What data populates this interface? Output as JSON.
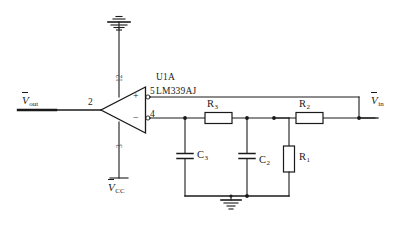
{
  "diagram": {
    "type": "electronic-circuit-schematic",
    "line_color": "#1a1a1a",
    "background_color": "#ffffff"
  },
  "component": {
    "designator": "U1A",
    "part_number": "LM339AJ",
    "symbol": "comparator-triangle",
    "pins": {
      "output": "2",
      "non_inverting_input": "5",
      "inverting_input": "4",
      "positive_supply": "12",
      "negative_supply": "3"
    },
    "input_signs": {
      "non_inverting": "+",
      "inverting": "−"
    }
  },
  "nets": {
    "output_label": "V",
    "output_sub": "out",
    "input_label": "V",
    "input_sub": "in",
    "supply_label": "V",
    "supply_sub": "CC",
    "ground_symbol": "earth-ground"
  },
  "passives": [
    {
      "ref": "R",
      "sub": "3",
      "type": "resistor",
      "orientation": "horizontal"
    },
    {
      "ref": "R",
      "sub": "2",
      "type": "resistor",
      "orientation": "horizontal"
    },
    {
      "ref": "R",
      "sub": "1",
      "type": "resistor",
      "orientation": "vertical"
    },
    {
      "ref": "C",
      "sub": "3",
      "type": "capacitor",
      "orientation": "vertical"
    },
    {
      "ref": "C",
      "sub": "2",
      "type": "capacitor",
      "orientation": "vertical"
    }
  ],
  "labels": {
    "pin2": "2",
    "pin5": "5",
    "pin4": "4",
    "pin12": "12",
    "pin3": "3",
    "plus": "+",
    "minus": "−"
  }
}
